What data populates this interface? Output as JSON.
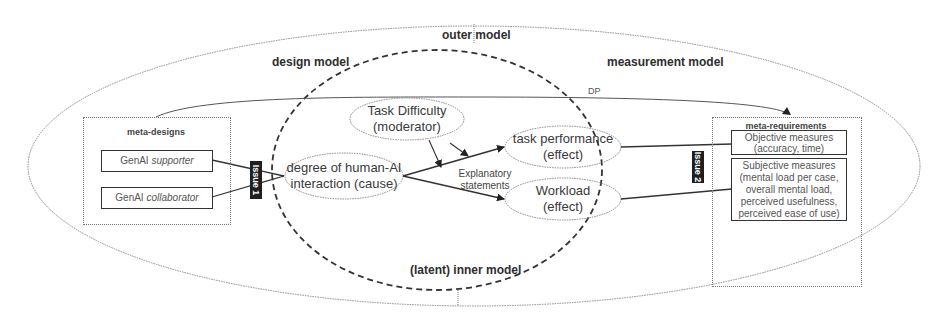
{
  "diagram": {
    "models": {
      "outer": "outer model",
      "design": "design model",
      "measurement": "measurement model",
      "inner": "(latent) inner model"
    },
    "meta_designs": {
      "title": "meta-designs",
      "items": [
        {
          "prefix": "GenAI ",
          "emphasis": "supporter"
        },
        {
          "prefix": "GenAI ",
          "emphasis": "collaborator"
        }
      ]
    },
    "meta_requirements": {
      "title": "meta-requirements",
      "objective": [
        "Objective measures",
        "(accuracy, time)"
      ],
      "subjective": [
        "Subjective measures",
        "(mental load per case,",
        "overall mental load,",
        "perceived usefulness,",
        "perceived ease of use)"
      ]
    },
    "constructs": {
      "cause": [
        "degree of human-AI",
        "interaction (cause)"
      ],
      "moderator": [
        "Task Difficulty",
        "(moderator)"
      ],
      "effect1": [
        "task performance",
        "(effect)"
      ],
      "effect2": [
        "Workload",
        "(effect)"
      ]
    },
    "explanatory": [
      "Explanatory",
      "statements"
    ],
    "issues": [
      "Issue 1",
      "Issue 2"
    ],
    "dp_label": "DP"
  }
}
